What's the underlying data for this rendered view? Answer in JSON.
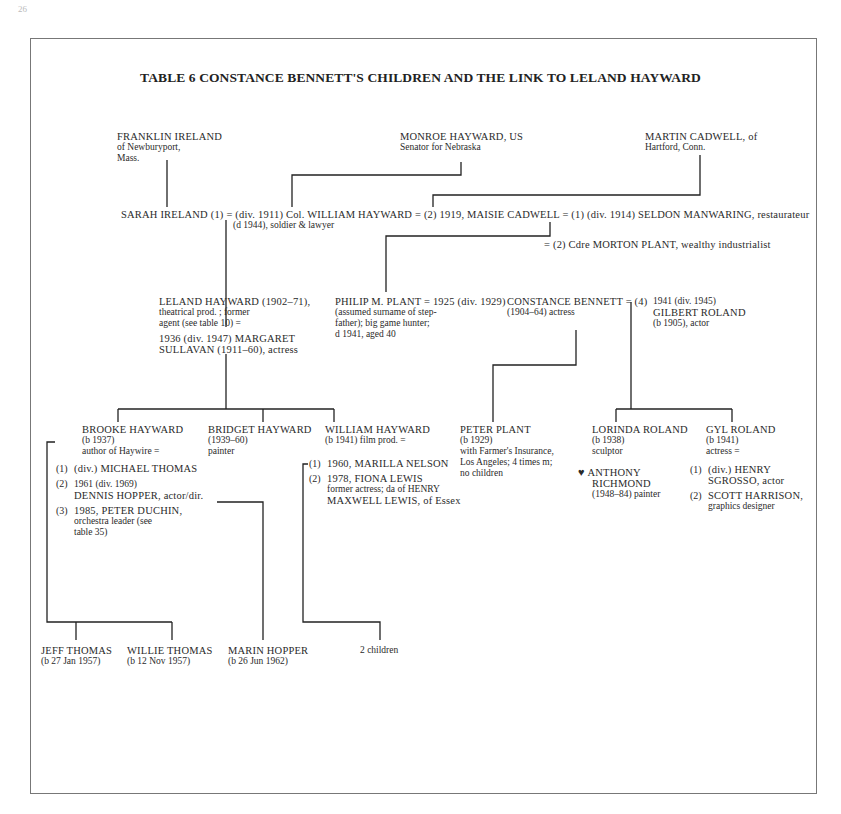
{
  "page": {
    "number": "26"
  },
  "title": "TABLE 6 CONSTANCE BENNETT'S CHILDREN AND THE LINK TO LELAND HAYWARD",
  "generation1": {
    "franklin": {
      "name": "FRANKLIN IRELAND",
      "line1": "of Newburyport,",
      "line2": "Mass."
    },
    "monroe": {
      "name": "MONROE HAYWARD, US",
      "line1": "Senator for Nebraska"
    },
    "martin": {
      "name": "MARTIN CADWELL, of",
      "line1": "Hartford, Conn."
    }
  },
  "generation2": {
    "marriage_line": "SARAH IRELAND (1) = (div. 1911) Col. WILLIAM HAYWARD = (2) 1919, MAISIE CADWELL  = (1) (div. 1914) SELDON MANWARING, restaurateur",
    "william_note": "(d 1944), soldier & lawyer",
    "morton": "= (2) Cdre MORTON PLANT, wealthy industrialist"
  },
  "generation3": {
    "leland": {
      "l1": "LELAND HAYWARD (1902–71),",
      "l2": "theatrical prod. ; former",
      "l3": "agent (see table 10) =",
      "l4": "1936 (div. 1947) MARGARET",
      "l5": "SULLAVAN (1911–60), actress"
    },
    "philip": {
      "l1": "PHILIP M. PLANT = 1925 (div. 1929)",
      "l2": "(assumed surname of step-",
      "l3": "father); big game hunter;",
      "l4": "d 1941, aged 40"
    },
    "constance": {
      "l1": "CONSTANCE BENNETT = (4)",
      "l2": "(1904–64) actress"
    },
    "gilbert": {
      "l1": "1941 (div. 1945)",
      "l2": "GILBERT ROLAND",
      "l3": "(b 1905), actor"
    }
  },
  "generation4": {
    "brooke": {
      "name": "BROOKE HAYWARD",
      "born": "(b 1937)",
      "note": "author of Haywire =",
      "spouses": [
        {
          "num": "(1)",
          "l1": "(div.) MICHAEL THOMAS"
        },
        {
          "num": "(2)",
          "l1": "1961 (div. 1969)",
          "l2": "DENNIS HOPPER, actor/dir."
        },
        {
          "num": "(3)",
          "l1": "1985, PETER DUCHIN,",
          "l2": "orchestra leader (see",
          "l3": "table 35)"
        }
      ]
    },
    "bridget": {
      "name": "BRIDGET HAYWARD",
      "born": "(1939–60)",
      "note": "painter"
    },
    "william": {
      "name": "WILLIAM HAYWARD",
      "born": "(b 1941) film prod. =",
      "spouses": [
        {
          "num": "(1)",
          "l1": "1960, MARILLA NELSON"
        },
        {
          "num": "(2)",
          "l1": "1978, FIONA LEWIS",
          "l2": "former actress; da of HENRY",
          "l3": "MAXWELL LEWIS, of Essex"
        }
      ]
    },
    "peter": {
      "name": "PETER PLANT",
      "born": "(b 1929)",
      "l1": "with Farmer's Insurance,",
      "l2": "Los Angeles; 4 times m;",
      "l3": "no children"
    },
    "lorinda": {
      "name": "LORINDA ROLAND",
      "born": "(b 1938)",
      "note": "sculptor",
      "partner_symbol": "♥",
      "partner_l1": "ANTHONY",
      "partner_l2": "RICHMOND",
      "partner_l3": "(1948–84) painter"
    },
    "gyl": {
      "name": "GYL ROLAND",
      "born": "(b 1941)",
      "note": "actress =",
      "spouses": [
        {
          "num": "(1)",
          "l1": "(div.) HENRY",
          "l2": "SGROSSO, actor"
        },
        {
          "num": "(2)",
          "l1": "SCOTT HARRISON,",
          "l2": "graphics designer"
        }
      ]
    }
  },
  "generation5": {
    "jeff": {
      "name": "JEFF THOMAS",
      "born": "(b 27 Jan 1957)"
    },
    "willie": {
      "name": "WILLIE THOMAS",
      "born": "(b 12 Nov 1957)"
    },
    "marin": {
      "name": "MARIN HOPPER",
      "born": "(b 26 Jun 1962)"
    },
    "william_children": {
      "name": "2 children"
    }
  }
}
